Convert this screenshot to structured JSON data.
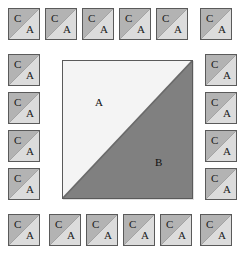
{
  "figure": {
    "width": 246,
    "height": 260,
    "background": "#ffffff",
    "grid": {
      "columns": 6,
      "rows": 6,
      "origin_x": 8,
      "origin_y": 8,
      "pitch_x": 37,
      "pitch_y": 38,
      "tile_size": 32
    }
  },
  "colors": {
    "page_background": "#ffffff",
    "tile_c_fill": "#b3b3b3",
    "tile_a_fill": "#dcdcdc",
    "tile_border": "#5a5a5a",
    "big_a_fill": "#f4f4f4",
    "big_b_fill": "#808080",
    "big_border": "#5a5a5a",
    "label_color": "#1a1a1a"
  },
  "big_square": {
    "name": "large-square",
    "x": 62,
    "y": 60,
    "width": 131,
    "height": 139,
    "diagonal": "bottom-left-to-top-right",
    "upper_label": "A",
    "lower_label": "B"
  },
  "tile_template": {
    "diagonal": "bottom-left-to-top-right",
    "upper_label": "C",
    "lower_label": "A"
  },
  "tiles": [
    {
      "id": "tile-r1c1",
      "row": 1,
      "col": 1,
      "x": 8,
      "y": 8,
      "upper_label": "C",
      "lower_label": "A"
    },
    {
      "id": "tile-r1c2",
      "row": 1,
      "col": 2,
      "x": 45,
      "y": 8,
      "upper_label": "C",
      "lower_label": "A"
    },
    {
      "id": "tile-r1c3",
      "row": 1,
      "col": 3,
      "x": 82,
      "y": 8,
      "upper_label": "C",
      "lower_label": "A"
    },
    {
      "id": "tile-r1c4",
      "row": 1,
      "col": 4,
      "x": 119,
      "y": 8,
      "upper_label": "C",
      "lower_label": "A"
    },
    {
      "id": "tile-r1c5",
      "row": 1,
      "col": 5,
      "x": 156,
      "y": 8,
      "upper_label": "C",
      "lower_label": "A"
    },
    {
      "id": "tile-r1c6",
      "row": 1,
      "col": 6,
      "x": 200,
      "y": 8,
      "upper_label": "C",
      "lower_label": "A"
    },
    {
      "id": "tile-r2c1",
      "row": 2,
      "col": 1,
      "x": 8,
      "y": 54,
      "upper_label": "C",
      "lower_label": "A"
    },
    {
      "id": "tile-r2c6",
      "row": 2,
      "col": 6,
      "x": 205,
      "y": 54,
      "upper_label": "C",
      "lower_label": "A"
    },
    {
      "id": "tile-r3c1",
      "row": 3,
      "col": 1,
      "x": 8,
      "y": 92,
      "upper_label": "C",
      "lower_label": "A"
    },
    {
      "id": "tile-r3c6",
      "row": 3,
      "col": 6,
      "x": 205,
      "y": 92,
      "upper_label": "C",
      "lower_label": "A"
    },
    {
      "id": "tile-r4c1",
      "row": 4,
      "col": 1,
      "x": 8,
      "y": 130,
      "upper_label": "C",
      "lower_label": "A"
    },
    {
      "id": "tile-r4c6",
      "row": 4,
      "col": 6,
      "x": 205,
      "y": 130,
      "upper_label": "C",
      "lower_label": "A"
    },
    {
      "id": "tile-r5c1",
      "row": 5,
      "col": 1,
      "x": 8,
      "y": 168,
      "upper_label": "C",
      "lower_label": "A"
    },
    {
      "id": "tile-r5c6",
      "row": 5,
      "col": 6,
      "x": 205,
      "y": 168,
      "upper_label": "C",
      "lower_label": "A"
    },
    {
      "id": "tile-r6c1",
      "row": 6,
      "col": 1,
      "x": 8,
      "y": 214,
      "upper_label": "C",
      "lower_label": "A"
    },
    {
      "id": "tile-r6c2",
      "row": 6,
      "col": 2,
      "x": 49,
      "y": 214,
      "upper_label": "C",
      "lower_label": "A"
    },
    {
      "id": "tile-r6c3",
      "row": 6,
      "col": 3,
      "x": 86,
      "y": 214,
      "upper_label": "C",
      "lower_label": "A"
    },
    {
      "id": "tile-r6c4",
      "row": 6,
      "col": 4,
      "x": 123,
      "y": 214,
      "upper_label": "C",
      "lower_label": "A"
    },
    {
      "id": "tile-r6c5",
      "row": 6,
      "col": 5,
      "x": 160,
      "y": 214,
      "upper_label": "C",
      "lower_label": "A"
    },
    {
      "id": "tile-r6c6",
      "row": 6,
      "col": 6,
      "x": 200,
      "y": 214,
      "upper_label": "C",
      "lower_label": "A"
    }
  ]
}
